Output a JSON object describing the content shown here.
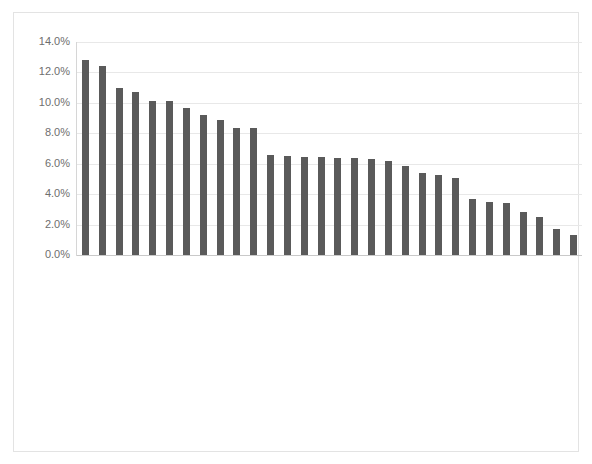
{
  "chart": {
    "axis": {
      "y_ticks": [
        "0.0%",
        "2.0%",
        "4.0%",
        "6.0%",
        "8.0%",
        "10.0%",
        "12.0%",
        "14.0%"
      ],
      "bar_color": "#5a5a5a",
      "gridline_color": "#e8e8e8",
      "border_color": "#e3e3e3"
    }
  },
  "chart_data": {
    "type": "bar",
    "title": "",
    "subtitle": "",
    "xlabel": "",
    "ylabel": "",
    "ylim": [
      0,
      14
    ],
    "ytick_values": [
      0,
      2,
      4,
      6,
      8,
      10,
      12,
      14
    ],
    "ytick_labels": [
      "0.0%",
      "2.0%",
      "4.0%",
      "6.0%",
      "8.0%",
      "10.0%",
      "12.0%",
      "14.0%"
    ],
    "grid": true,
    "legend": false,
    "orientation": "vertical",
    "value_format": "percent",
    "categories": [
      "Weapons and Tactics",
      "Intelligence Flight",
      "Civil Engineering",
      "Transportation",
      "Supply",
      "Logistics Plan",
      "Air Force Weather Operations",
      "Chaplain",
      "Security Forces",
      "Operations Plans Flight",
      "Services",
      "Squadron Commander's Support Sta",
      "Aerial Ports",
      "Wing Commander's Support Staff",
      "Military Personnel Flight",
      "Contracting",
      "Communications",
      "Group Commander's Support Staff",
      "Current Operations Flight",
      "Safety",
      "Command Post",
      "Wing Plans",
      "Manpower",
      "Staff Judge Advocate",
      "Test, Measurement, and Diagnosti",
      "Education Services",
      "Postal",
      "Medical Group",
      "Public Affairs",
      "Financial Management"
    ],
    "values": [
      12.8,
      12.4,
      11.0,
      10.7,
      10.1,
      10.1,
      9.65,
      9.2,
      8.85,
      8.35,
      8.35,
      6.6,
      6.5,
      6.45,
      6.45,
      6.4,
      6.35,
      6.3,
      6.2,
      5.85,
      5.4,
      5.25,
      5.05,
      3.7,
      3.5,
      3.45,
      2.8,
      2.5,
      1.7,
      1.3
    ]
  }
}
